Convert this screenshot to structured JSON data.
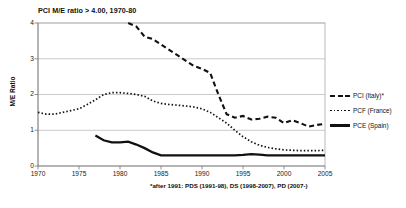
{
  "chart_data": {
    "type": "line",
    "title": "PCI M/E ratio > 4.00, 1970-80",
    "xlabel": "",
    "ylabel": "M/E Ratio",
    "xlim": [
      1970,
      2005
    ],
    "ylim": [
      0,
      4
    ],
    "grid": true,
    "legend_position": "right",
    "footnote": "*after 1991: PDS (1991-98), DS (1998-2007), PD (2007-)",
    "yticks": [
      "0",
      "1",
      "2",
      "3",
      "4"
    ],
    "xticks": [
      "1970",
      "1975",
      "1980",
      "1985",
      "1990",
      "1995",
      "2000",
      "2005"
    ],
    "series": [
      {
        "name": "PCI (Italy)*",
        "style": "dashed",
        "color": "#111111",
        "note": "values above 4.00 before 1981 are off-scale",
        "x": [
          1981,
          1982,
          1983,
          1984,
          1985,
          1986,
          1987,
          1988,
          1989,
          1990,
          1991,
          1992,
          1993,
          1994,
          1995,
          1996,
          1997,
          1998,
          1999,
          2000,
          2001,
          2002,
          2003,
          2004,
          2005
        ],
        "y": [
          4.0,
          3.9,
          3.62,
          3.55,
          3.4,
          3.25,
          3.1,
          2.95,
          2.8,
          2.72,
          2.6,
          2.0,
          1.45,
          1.35,
          1.4,
          1.3,
          1.32,
          1.38,
          1.35,
          1.2,
          1.28,
          1.2,
          1.1,
          1.15,
          1.18
        ]
      },
      {
        "name": "PCF (France)",
        "style": "dotted",
        "color": "#111111",
        "x": [
          1970,
          1971,
          1972,
          1973,
          1974,
          1975,
          1976,
          1977,
          1978,
          1979,
          1980,
          1981,
          1982,
          1983,
          1984,
          1985,
          1986,
          1987,
          1988,
          1989,
          1990,
          1991,
          1992,
          1993,
          1994,
          1995,
          1996,
          1997,
          1998,
          1999,
          2000,
          2001,
          2002,
          2003,
          2004,
          2005
        ],
        "y": [
          1.5,
          1.45,
          1.45,
          1.5,
          1.55,
          1.6,
          1.72,
          1.85,
          2.0,
          2.05,
          2.05,
          2.03,
          2.0,
          1.95,
          1.82,
          1.75,
          1.72,
          1.7,
          1.68,
          1.65,
          1.6,
          1.5,
          1.35,
          1.2,
          1.0,
          0.82,
          0.68,
          0.58,
          0.52,
          0.48,
          0.45,
          0.44,
          0.43,
          0.43,
          0.43,
          0.44
        ]
      },
      {
        "name": "PCE (Spain)",
        "style": "solid",
        "color": "#111111",
        "x": [
          1977,
          1978,
          1979,
          1980,
          1981,
          1982,
          1983,
          1984,
          1985,
          1986,
          1987,
          1988,
          1989,
          1990,
          1991,
          1992,
          1993,
          1994,
          1995,
          1996,
          1997,
          1998,
          1999,
          2000,
          2001,
          2002,
          2003,
          2004,
          2005
        ],
        "y": [
          0.85,
          0.72,
          0.66,
          0.66,
          0.68,
          0.6,
          0.5,
          0.38,
          0.3,
          0.3,
          0.3,
          0.3,
          0.3,
          0.3,
          0.3,
          0.3,
          0.3,
          0.3,
          0.31,
          0.33,
          0.32,
          0.3,
          0.3,
          0.3,
          0.3,
          0.3,
          0.3,
          0.3,
          0.3
        ]
      }
    ]
  },
  "legend": {
    "items": [
      {
        "label": "PCI (Italy)*",
        "style": "dashed"
      },
      {
        "label": "PCF (France)",
        "style": "dotted"
      },
      {
        "label": "PCE (Spain)",
        "style": "solid"
      }
    ]
  }
}
